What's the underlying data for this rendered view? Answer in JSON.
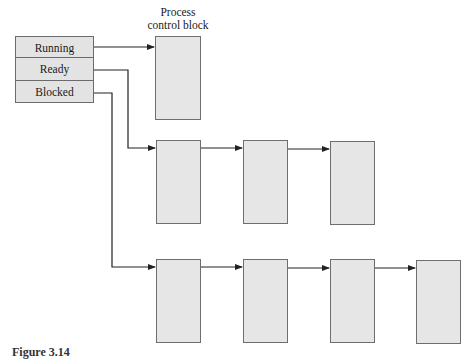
{
  "diagram": {
    "states": [
      {
        "label": "Running"
      },
      {
        "label": "Ready"
      },
      {
        "label": "Blocked"
      }
    ],
    "pcb_label": {
      "line1": "Process",
      "line2": "control block"
    },
    "queues": {
      "running": {
        "count": 1
      },
      "ready": {
        "count": 3
      },
      "blocked": {
        "count": 4
      }
    },
    "colors": {
      "box_fill": "#e6e6e6",
      "box_border": "#6e6e6e",
      "line": "#222222"
    }
  },
  "caption": {
    "text": "Figure 3.14"
  }
}
